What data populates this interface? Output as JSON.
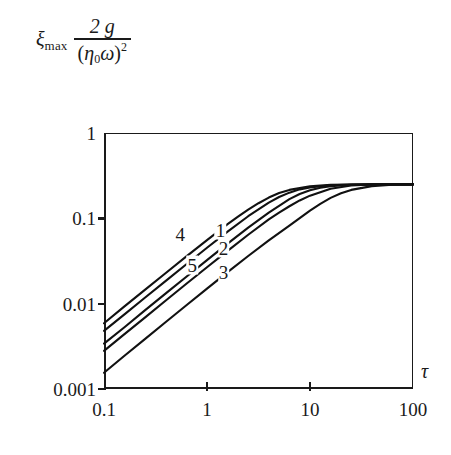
{
  "figure": {
    "y_axis_label": {
      "variable": "ξ",
      "variable_subscript": "max",
      "numerator": "2 g",
      "denominator_open": "(",
      "denominator_eta": "η",
      "denominator_eta_sub": "0",
      "denominator_omega": "ω",
      "denominator_close": ")",
      "denominator_exponent": "2"
    },
    "x_axis_label": "τ"
  },
  "chart_data": {
    "type": "line",
    "title": "",
    "xlabel": "τ",
    "ylabel": "ξ_max · 2g/(η₀ω)²",
    "xscale": "log",
    "yscale": "log",
    "xlim": [
      0.1,
      100
    ],
    "ylim": [
      0.001,
      1
    ],
    "xticks": [
      0.1,
      1,
      10,
      100
    ],
    "xtick_labels": [
      "0.1",
      "1",
      "10",
      "100"
    ],
    "yticks": [
      0.001,
      0.01,
      0.1,
      1
    ],
    "ytick_labels": [
      "0.001",
      "0.01",
      "0.1",
      "1"
    ],
    "grid": false,
    "legend": "inline-curve-numbers",
    "plateau_value": 0.25,
    "series": [
      {
        "name": "1",
        "label": "1",
        "label_x": 1.35,
        "label_y": 0.073,
        "x": [
          0.1,
          0.158,
          0.251,
          0.398,
          0.631,
          1.0,
          1.585,
          2.512,
          3.981,
          5.012,
          6.31,
          7.94,
          10.0,
          15.85,
          25.12,
          39.81,
          63.1,
          100.0
        ],
        "y": [
          0.0048,
          0.0075,
          0.0118,
          0.0185,
          0.029,
          0.0452,
          0.0699,
          0.1058,
          0.1525,
          0.178,
          0.2,
          0.2185,
          0.2303,
          0.2438,
          0.2487,
          0.2498,
          0.25,
          0.25
        ]
      },
      {
        "name": "2",
        "label": "2",
        "label_x": 1.45,
        "label_y": 0.0455,
        "x": [
          0.1,
          0.158,
          0.251,
          0.398,
          0.631,
          1.0,
          1.585,
          2.512,
          3.981,
          6.31,
          7.94,
          10.0,
          12.59,
          15.85,
          25.12,
          39.81,
          63.1,
          100.0
        ],
        "y": [
          0.0034,
          0.0053,
          0.0084,
          0.0132,
          0.0207,
          0.0324,
          0.0505,
          0.0778,
          0.1165,
          0.168,
          0.193,
          0.2135,
          0.2285,
          0.2385,
          0.2475,
          0.2496,
          0.25,
          0.25
        ]
      },
      {
        "name": "3",
        "label": "3",
        "label_x": 1.45,
        "label_y": 0.0233,
        "x": [
          0.1,
          0.158,
          0.251,
          0.398,
          0.631,
          1.0,
          1.585,
          2.512,
          3.981,
          6.31,
          10.0,
          12.59,
          15.85,
          20.0,
          25.12,
          39.81,
          63.1,
          100.0
        ],
        "y": [
          0.00155,
          0.00245,
          0.00387,
          0.0061,
          0.00958,
          0.015,
          0.0234,
          0.0362,
          0.0553,
          0.0823,
          0.1233,
          0.148,
          0.1735,
          0.1965,
          0.2155,
          0.2385,
          0.2475,
          0.25
        ]
      },
      {
        "name": "4",
        "label": "4",
        "label_x": 0.55,
        "label_y": 0.0655,
        "x": [
          0.1,
          0.158,
          0.251,
          0.398,
          0.631,
          1.0,
          1.585,
          2.0,
          2.512,
          3.162,
          3.981,
          5.012,
          6.31,
          10.0,
          15.85,
          25.12,
          39.81,
          63.1,
          100.0
        ],
        "y": [
          0.0059,
          0.0093,
          0.0146,
          0.0229,
          0.0358,
          0.0556,
          0.0855,
          0.1045,
          0.1262,
          0.1503,
          0.1752,
          0.198,
          0.2155,
          0.2375,
          0.2468,
          0.2492,
          0.25,
          0.25,
          0.25
        ]
      },
      {
        "name": "5",
        "label": "5",
        "label_x": 0.72,
        "label_y": 0.0285,
        "x": [
          0.1,
          0.158,
          0.251,
          0.398,
          0.631,
          1.0,
          1.585,
          2.512,
          3.981,
          5.012,
          6.31,
          7.94,
          10.0,
          15.85,
          25.12,
          39.81,
          63.1,
          100.0
        ],
        "y": [
          0.0028,
          0.0044,
          0.0069,
          0.0109,
          0.0171,
          0.0267,
          0.0416,
          0.0642,
          0.0971,
          0.1165,
          0.1385,
          0.162,
          0.1845,
          0.2225,
          0.2425,
          0.2488,
          0.2498,
          0.25
        ]
      }
    ]
  }
}
